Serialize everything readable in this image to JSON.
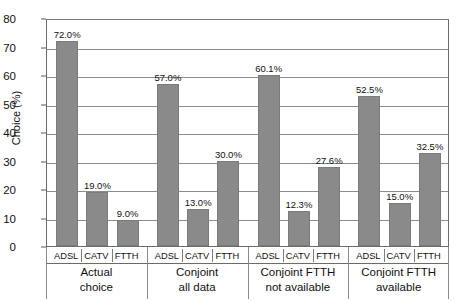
{
  "chart_data": {
    "type": "bar",
    "title": "",
    "xlabel": "",
    "ylabel": "Choice (%)",
    "ylim": [
      0,
      80
    ],
    "ytick_values": [
      80,
      70,
      60,
      50,
      40,
      30,
      20,
      10,
      0
    ],
    "ytick_labels": [
      "80",
      "70",
      "60",
      "50",
      "40",
      "30",
      "20",
      "10",
      "0"
    ],
    "grid": true,
    "legend": "none",
    "categories": [
      "ADSL",
      "CATV",
      "FTTH"
    ],
    "group_labels": [
      "Actual\nchoice",
      "Conjoint\nall data",
      "Conjoint FTTH\nnot available",
      "Conjoint FTTH\navailable"
    ],
    "groups": [
      {
        "name": "Actual choice",
        "line1": "Actual",
        "line2": "choice",
        "bars": [
          {
            "category": "ADSL",
            "value": 72.0,
            "label": "72.0%"
          },
          {
            "category": "CATV",
            "value": 19.0,
            "label": "19.0%"
          },
          {
            "category": "FTTH",
            "value": 9.0,
            "label": "9.0%"
          }
        ]
      },
      {
        "name": "Conjoint all data",
        "line1": "Conjoint",
        "line2": "all data",
        "bars": [
          {
            "category": "ADSL",
            "value": 57.0,
            "label": "57.0%"
          },
          {
            "category": "CATV",
            "value": 13.0,
            "label": "13.0%"
          },
          {
            "category": "FTTH",
            "value": 30.0,
            "label": "30.0%"
          }
        ]
      },
      {
        "name": "Conjoint FTTH not available",
        "line1": "Conjoint FTTH",
        "line2": "not available",
        "bars": [
          {
            "category": "ADSL",
            "value": 60.1,
            "label": "60.1%"
          },
          {
            "category": "CATV",
            "value": 12.3,
            "label": "12.3%"
          },
          {
            "category": "FTTH",
            "value": 27.6,
            "label": "27.6%"
          }
        ]
      },
      {
        "name": "Conjoint FTTH available",
        "line1": "Conjoint FTTH",
        "line2": "available",
        "bars": [
          {
            "category": "ADSL",
            "value": 52.5,
            "label": "52.5%"
          },
          {
            "category": "CATV",
            "value": 15.0,
            "label": "15.0%"
          },
          {
            "category": "FTTH",
            "value": 32.5,
            "label": "32.5%"
          }
        ]
      }
    ],
    "colors": {
      "bar_fill": "#8a8a8a",
      "bar_stroke": "#7b7b7b",
      "gridline": "#8c8c8c",
      "frame": "#6b6b6b",
      "text": "#111111",
      "background": "#ffffff"
    }
  }
}
